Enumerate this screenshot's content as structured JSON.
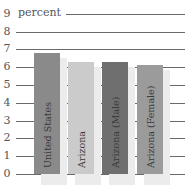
{
  "chart_data": {
    "type": "bar",
    "title": "",
    "unit_label": "percent",
    "xlabel": "",
    "ylabel": "percent",
    "ylim": [
      0,
      9
    ],
    "yticks": [
      "0",
      "1",
      "2",
      "3",
      "4",
      "5",
      "6",
      "7",
      "8",
      "9"
    ],
    "grid": true,
    "legend": null,
    "categories": [
      "United States",
      "Arizona",
      "Arizona (Male)",
      "Arizona (Female)"
    ],
    "values": [
      6.8,
      6.3,
      6.3,
      6.1
    ],
    "colors": [
      "#8a8a8a",
      "#cbcbcb",
      "#6f6f6f",
      "#9b9b9b"
    ]
  }
}
